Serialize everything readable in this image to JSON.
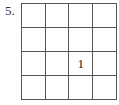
{
  "problem": {
    "number_label": "5.",
    "grid": {
      "rows": 4,
      "cols": 4,
      "cells": [
        [
          "",
          "",
          "",
          ""
        ],
        [
          "",
          "",
          "",
          ""
        ],
        [
          "",
          "",
          "1",
          ""
        ],
        [
          "",
          "",
          "",
          ""
        ]
      ]
    }
  }
}
